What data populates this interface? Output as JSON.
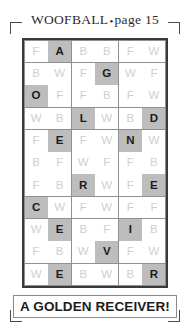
{
  "header": {
    "title": "WOOFBALL",
    "separator": "•",
    "page_label": "page 15"
  },
  "grid": {
    "columns": 6,
    "rows": 11,
    "shaded_color": "#bdbdbd",
    "unshaded_color": "#ffffff",
    "shaded_text_color": "#1c1c1c",
    "unshaded_text_color": "#cfcfcf",
    "border_color": "#3a3a3a",
    "cells": [
      [
        {
          "letter": "F",
          "shaded": false
        },
        {
          "letter": "A",
          "shaded": true
        },
        {
          "letter": "B",
          "shaded": false
        },
        {
          "letter": "B",
          "shaded": false
        },
        {
          "letter": "F",
          "shaded": false
        },
        {
          "letter": "W",
          "shaded": false
        }
      ],
      [
        {
          "letter": "B",
          "shaded": false
        },
        {
          "letter": "W",
          "shaded": false
        },
        {
          "letter": "F",
          "shaded": false
        },
        {
          "letter": "G",
          "shaded": true
        },
        {
          "letter": "W",
          "shaded": false
        },
        {
          "letter": "F",
          "shaded": false
        }
      ],
      [
        {
          "letter": "O",
          "shaded": true
        },
        {
          "letter": "F",
          "shaded": false
        },
        {
          "letter": "F",
          "shaded": false
        },
        {
          "letter": "B",
          "shaded": false
        },
        {
          "letter": "F",
          "shaded": false
        },
        {
          "letter": "W",
          "shaded": false
        }
      ],
      [
        {
          "letter": "W",
          "shaded": false
        },
        {
          "letter": "B",
          "shaded": false
        },
        {
          "letter": "L",
          "shaded": true
        },
        {
          "letter": "W",
          "shaded": false
        },
        {
          "letter": "B",
          "shaded": false
        },
        {
          "letter": "D",
          "shaded": true
        }
      ],
      [
        {
          "letter": "F",
          "shaded": false
        },
        {
          "letter": "E",
          "shaded": true
        },
        {
          "letter": "F",
          "shaded": false
        },
        {
          "letter": "W",
          "shaded": false
        },
        {
          "letter": "N",
          "shaded": true
        },
        {
          "letter": "W",
          "shaded": false
        }
      ],
      [
        {
          "letter": "B",
          "shaded": false
        },
        {
          "letter": "F",
          "shaded": false
        },
        {
          "letter": "W",
          "shaded": false
        },
        {
          "letter": "F",
          "shaded": false
        },
        {
          "letter": "F",
          "shaded": false
        },
        {
          "letter": "B",
          "shaded": false
        }
      ],
      [
        {
          "letter": "F",
          "shaded": false
        },
        {
          "letter": "B",
          "shaded": false
        },
        {
          "letter": "R",
          "shaded": true
        },
        {
          "letter": "W",
          "shaded": false
        },
        {
          "letter": "F",
          "shaded": false
        },
        {
          "letter": "E",
          "shaded": true
        }
      ],
      [
        {
          "letter": "C",
          "shaded": true
        },
        {
          "letter": "W",
          "shaded": false
        },
        {
          "letter": "F",
          "shaded": false
        },
        {
          "letter": "W",
          "shaded": false
        },
        {
          "letter": "F",
          "shaded": false
        },
        {
          "letter": "F",
          "shaded": false
        }
      ],
      [
        {
          "letter": "W",
          "shaded": false
        },
        {
          "letter": "E",
          "shaded": true
        },
        {
          "letter": "B",
          "shaded": false
        },
        {
          "letter": "F",
          "shaded": false
        },
        {
          "letter": "I",
          "shaded": true
        },
        {
          "letter": "B",
          "shaded": false
        }
      ],
      [
        {
          "letter": "F",
          "shaded": false
        },
        {
          "letter": "B",
          "shaded": false
        },
        {
          "letter": "W",
          "shaded": false
        },
        {
          "letter": "V",
          "shaded": true
        },
        {
          "letter": "F",
          "shaded": false
        },
        {
          "letter": "W",
          "shaded": false
        }
      ],
      [
        {
          "letter": "W",
          "shaded": false
        },
        {
          "letter": "E",
          "shaded": true
        },
        {
          "letter": "B",
          "shaded": false
        },
        {
          "letter": "W",
          "shaded": false
        },
        {
          "letter": "B",
          "shaded": false
        },
        {
          "letter": "R",
          "shaded": true
        }
      ]
    ]
  },
  "answer": {
    "text": "A GOLDEN RECEIVER!"
  }
}
